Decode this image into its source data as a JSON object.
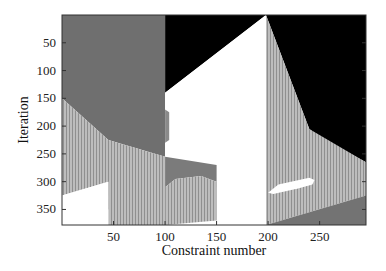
{
  "chart_data": {
    "type": "heatmap",
    "title": "",
    "xlabel": "Constraint number",
    "ylabel": "Iteration",
    "xlim": [
      0,
      295
    ],
    "ylim": [
      0,
      378
    ],
    "y_reversed": true,
    "x_ticks": [
      50,
      100,
      150,
      200,
      250
    ],
    "y_ticks": [
      50,
      100,
      150,
      200,
      250,
      300,
      350
    ],
    "grid": false,
    "legend": null,
    "colors": {
      "dark_gray": "#6e6e6e",
      "black": "#000000",
      "white": "#ffffff",
      "light_gray_striped": "#b4b4b4",
      "medium_gray": "#7a7a7a"
    },
    "regions": [
      {
        "name": "block1-dark",
        "fill": "#6f6f6f",
        "points": [
          [
            0,
            0
          ],
          [
            100,
            0
          ],
          [
            100,
            255
          ],
          [
            45,
            225
          ],
          [
            0,
            150
          ]
        ]
      },
      {
        "name": "block1-light",
        "fill": "#b5b5b5",
        "striped": true,
        "points": [
          [
            0,
            150
          ],
          [
            45,
            225
          ],
          [
            100,
            255
          ],
          [
            100,
            378
          ],
          [
            45,
            378
          ],
          [
            45,
            345
          ],
          [
            95,
            330
          ],
          [
            95,
            350
          ],
          [
            45,
            350
          ],
          [
            45,
            300
          ],
          [
            0,
            325
          ]
        ]
      },
      {
        "name": "block1-light-right",
        "fill": "#b5b5b5",
        "striped": true,
        "points": [
          [
            45,
            300
          ],
          [
            45,
            350
          ],
          [
            100,
            330
          ],
          [
            100,
            255
          ],
          [
            45,
            230
          ]
        ]
      },
      {
        "name": "block1-white",
        "fill": "#ffffff",
        "points": [
          [
            0,
            325
          ],
          [
            45,
            300
          ],
          [
            45,
            378
          ],
          [
            0,
            378
          ]
        ]
      },
      {
        "name": "block2-black",
        "fill": "#000000",
        "points": [
          [
            100,
            0
          ],
          [
            198,
            0
          ],
          [
            100,
            140
          ]
        ]
      },
      {
        "name": "block2-white",
        "fill": "#ffffff",
        "points": [
          [
            100,
            140
          ],
          [
            198,
            0
          ],
          [
            198,
            378
          ],
          [
            150,
            378
          ],
          [
            150,
            300
          ],
          [
            100,
            255
          ]
        ]
      },
      {
        "name": "block2-dark",
        "fill": "#7b7b7b",
        "points": [
          [
            100,
            255
          ],
          [
            150,
            270
          ],
          [
            150,
            300
          ],
          [
            135,
            290
          ],
          [
            110,
            295
          ],
          [
            100,
            310
          ]
        ]
      },
      {
        "name": "block2-light",
        "fill": "#b5b5b5",
        "striped": true,
        "points": [
          [
            100,
            310
          ],
          [
            110,
            295
          ],
          [
            135,
            290
          ],
          [
            150,
            300
          ],
          [
            150,
            370
          ],
          [
            100,
            378
          ]
        ]
      },
      {
        "name": "block2-stripes-small",
        "fill": "#8a8a8a",
        "points": [
          [
            100,
            170
          ],
          [
            104,
            175
          ],
          [
            104,
            225
          ],
          [
            100,
            230
          ]
        ]
      },
      {
        "name": "block3-black",
        "fill": "#000000",
        "points": [
          [
            198,
            0
          ],
          [
            295,
            0
          ],
          [
            295,
            265
          ],
          [
            250,
            220
          ],
          [
            240,
            205
          ],
          [
            198,
            0
          ]
        ]
      },
      {
        "name": "block3-light",
        "fill": "#b5b5b5",
        "striped": true,
        "points": [
          [
            198,
            0
          ],
          [
            240,
            205
          ],
          [
            295,
            265
          ],
          [
            295,
            325
          ],
          [
            198,
            378
          ]
        ]
      },
      {
        "name": "block3-white-blob",
        "fill": "#ffffff",
        "points": [
          [
            200,
            320
          ],
          [
            210,
            305
          ],
          [
            240,
            293
          ],
          [
            245,
            297
          ],
          [
            243,
            305
          ],
          [
            230,
            312
          ],
          [
            205,
            322
          ]
        ]
      },
      {
        "name": "block3-dark",
        "fill": "#737373",
        "points": [
          [
            198,
            378
          ],
          [
            295,
            325
          ],
          [
            295,
            378
          ]
        ]
      }
    ]
  }
}
